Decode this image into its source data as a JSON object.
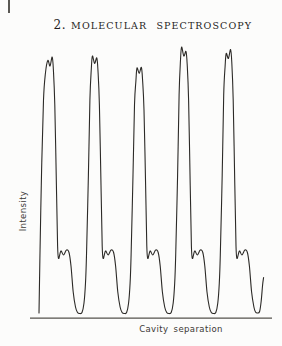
{
  "header": {
    "chapter_number": "2.",
    "chapter_title": "MOLECULAR SPECTROSCOPY"
  },
  "chart": {
    "y_axis_label": "Intensity",
    "x_axis_label": "Cavity separation",
    "line_color": "#2c2a27",
    "axis_color": "#55524d"
  },
  "chart_data": {
    "type": "line",
    "title": "",
    "xlabel": "Cavity separation",
    "ylabel": "Intensity",
    "x_tick_labels": [],
    "y_tick_labels": [],
    "grid": false,
    "legend": false,
    "units": "pixel coordinates in 282x346 viewport, y increases downward",
    "axis": {
      "x_start": 30,
      "x_end": 272,
      "baseline_y": 318.2
    },
    "main_fringes": [
      {
        "x": 50.0,
        "doublet_top_y": [
          60.5,
          57.0
        ]
      },
      {
        "x": 94.6,
        "doublet_top_y": [
          56.0,
          58.0
        ]
      },
      {
        "x": 139.2,
        "doublet_top_y": [
          68.0,
          67.5
        ]
      },
      {
        "x": 183.8,
        "doublet_top_y": [
          47.0,
          51.5
        ]
      },
      {
        "x": 228.4,
        "doublet_top_y": [
          53.5,
          49.5
        ]
      }
    ],
    "secondary_fringe_top_y": 250,
    "minimum_y": 313.5,
    "curve_points": [
      [
        39,
        313
      ],
      [
        39.9,
        258
      ],
      [
        41.6,
        170
      ],
      [
        43.5,
        100
      ],
      [
        45.4,
        73.5
      ],
      [
        47.8,
        60.5
      ],
      [
        50,
        66
      ],
      [
        52.2,
        57
      ],
      [
        53.4,
        70
      ],
      [
        54.8,
        105
      ],
      [
        56.4,
        185
      ],
      [
        57.6,
        246
      ],
      [
        58.6,
        258.5
      ],
      [
        60.9,
        251
      ],
      [
        63.5,
        255
      ],
      [
        66.5,
        250
      ],
      [
        69,
        252.5
      ],
      [
        71,
        266
      ],
      [
        73.2,
        292
      ],
      [
        75.5,
        307
      ],
      [
        77.5,
        312.5
      ],
      [
        79.7,
        313.5
      ],
      [
        82,
        312.5
      ],
      [
        84,
        303
      ],
      [
        85.5,
        283
      ],
      [
        86.5,
        255
      ],
      [
        88.4,
        175
      ],
      [
        89.9,
        100
      ],
      [
        91.3,
        69
      ],
      [
        92.4,
        56
      ],
      [
        94.6,
        63.5
      ],
      [
        96.8,
        58
      ],
      [
        98,
        71
      ],
      [
        99.4,
        105
      ],
      [
        101,
        185
      ],
      [
        102.2,
        246
      ],
      [
        103.2,
        258.5
      ],
      [
        105.5,
        251
      ],
      [
        108.1,
        255
      ],
      [
        111.1,
        250
      ],
      [
        113.6,
        252.5
      ],
      [
        115.6,
        266
      ],
      [
        117.8,
        292
      ],
      [
        120.1,
        307
      ],
      [
        122.1,
        312.5
      ],
      [
        124.3,
        313.5
      ],
      [
        126.6,
        312.5
      ],
      [
        128.6,
        303
      ],
      [
        130.1,
        283
      ],
      [
        131.1,
        255
      ],
      [
        133,
        175
      ],
      [
        134.5,
        105
      ],
      [
        135.9,
        81
      ],
      [
        137,
        68
      ],
      [
        139.2,
        73.5
      ],
      [
        141.4,
        67.5
      ],
      [
        142.6,
        80.5
      ],
      [
        144,
        110
      ],
      [
        145.6,
        185
      ],
      [
        146.8,
        246
      ],
      [
        147.8,
        258.5
      ],
      [
        150.1,
        251
      ],
      [
        152.7,
        255
      ],
      [
        155.7,
        250
      ],
      [
        158.2,
        252.5
      ],
      [
        160.2,
        266
      ],
      [
        162.4,
        292
      ],
      [
        164.7,
        307
      ],
      [
        166.7,
        312.5
      ],
      [
        168.9,
        313.5
      ],
      [
        171.2,
        312.5
      ],
      [
        173.2,
        303
      ],
      [
        174.7,
        283
      ],
      [
        175.7,
        255
      ],
      [
        177.6,
        175
      ],
      [
        179.1,
        95
      ],
      [
        180.5,
        60
      ],
      [
        181.6,
        47
      ],
      [
        183.8,
        56
      ],
      [
        186,
        51.5
      ],
      [
        187.2,
        64.5
      ],
      [
        188.6,
        100
      ],
      [
        190.2,
        185
      ],
      [
        191.4,
        246
      ],
      [
        192.4,
        258.5
      ],
      [
        194.7,
        251
      ],
      [
        197.3,
        255
      ],
      [
        200.3,
        250
      ],
      [
        202.8,
        252.5
      ],
      [
        204.8,
        266
      ],
      [
        207,
        292
      ],
      [
        209.3,
        307
      ],
      [
        211.3,
        312.5
      ],
      [
        213.5,
        313.5
      ],
      [
        215.8,
        312.5
      ],
      [
        217.8,
        303
      ],
      [
        219.3,
        283
      ],
      [
        220.3,
        255
      ],
      [
        222.2,
        175
      ],
      [
        223.7,
        95
      ],
      [
        225.1,
        66.5
      ],
      [
        226.2,
        53.5
      ],
      [
        228.4,
        58.5
      ],
      [
        230.6,
        49.5
      ],
      [
        231.8,
        62.5
      ],
      [
        233.2,
        100
      ],
      [
        234.8,
        185
      ],
      [
        236,
        246
      ],
      [
        237,
        258.5
      ],
      [
        239.4,
        251
      ],
      [
        241.9,
        255
      ],
      [
        244.9,
        250
      ],
      [
        247.4,
        252.5
      ],
      [
        249.4,
        266
      ],
      [
        251.6,
        292
      ],
      [
        253.9,
        307
      ],
      [
        255.5,
        312
      ],
      [
        257.5,
        313
      ],
      [
        259.6,
        311.5
      ],
      [
        261.2,
        301
      ],
      [
        262.6,
        285
      ],
      [
        263.6,
        277.5
      ]
    ]
  }
}
